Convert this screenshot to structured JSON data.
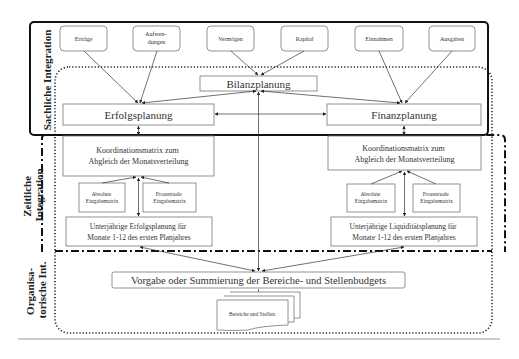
{
  "diagram": {
    "sections": {
      "sachliche": "Sachliche Integration",
      "zeitliche_line1": "Zeitliche",
      "zeitliche_line2": "Integration",
      "organisatorische_line1": "Organisa-",
      "organisatorische_line2": "torische Int."
    },
    "sources": [
      {
        "id": "ertraege",
        "label": "Erträge"
      },
      {
        "id": "aufwendungen",
        "label_line1": "Aufwen-",
        "label_line2": "dungen"
      },
      {
        "id": "vermoegen",
        "label": "Vermögen"
      },
      {
        "id": "kapital",
        "label": "Kapital"
      },
      {
        "id": "einnahmen",
        "label": "Einnahmen"
      },
      {
        "id": "ausgaben",
        "label": "Ausgaben"
      }
    ],
    "bilanzplanung": "Bilanzplanung",
    "erfolgsplanung": "Erfolgsplanung",
    "finanzplanung": "Finanzplanung",
    "left_column": {
      "koordination_line1": "Koordinationsmatrix zum",
      "koordination_line2": "Abgleich der Monatsverteilung",
      "absolute_line1": "Absolute",
      "absolute_line2": "Eingabematrix",
      "prozentuale_line1": "Prozentuale",
      "prozentuale_line2": "Eingabematrix",
      "unterjaehrig_line1": "Unterjährige Erfolgsplanung für",
      "unterjaehrig_line2": "Monate 1-12 des ersten Planjahres"
    },
    "right_column": {
      "koordination_line1": "Koordinationsmatrix zum",
      "koordination_line2": "Abgleich der Monatsverteilung",
      "absolute_line1": "Absolute",
      "absolute_line2": "Eingabematrix",
      "prozentuale_line1": "Prozentuale",
      "prozentuale_line2": "Eingabematrix",
      "unterjaehrig_line1": "Unterjährige Liquiditätsplanung für",
      "unterjaehrig_line2": "Monate 1-12 des ersten Planjahres"
    },
    "vorgabe": "Vorgabe oder Summierung der Bereiche- und Stellenbudgets",
    "bereiche": "Bereiche und Stellen"
  },
  "colors": {
    "stroke": "#333333",
    "box_stroke": "#777777",
    "text": "#333333",
    "divider": "#999999"
  }
}
